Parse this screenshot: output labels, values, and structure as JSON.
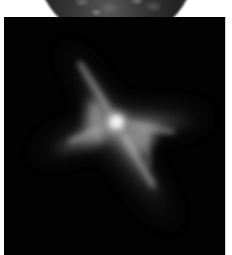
{
  "image": {
    "subject": "nebula",
    "description": "Grayscale astronomical image of an X-shaped bipolar nebula with a bright central star, below a partially visible dark textured sphere against a white background",
    "colors": {
      "background": "#ffffff",
      "panel": "#020202",
      "nebula_core": "#f2f2f2",
      "nebula_glow": "#8a8a8a",
      "sphere_dark": "#222222",
      "sphere_edge": "#9a9a9a"
    }
  }
}
